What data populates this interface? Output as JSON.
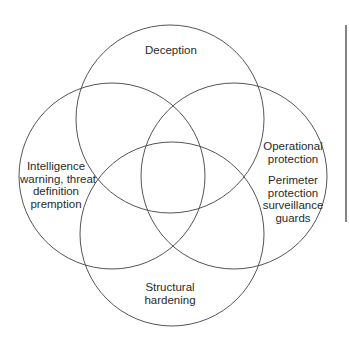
{
  "diagram": {
    "type": "venn",
    "sets": [
      {
        "id": "top",
        "label": "Deception"
      },
      {
        "id": "left",
        "label_lines": [
          "Intelligence",
          "warning, threat",
          "definition",
          "premption"
        ]
      },
      {
        "id": "right",
        "label_lines": [
          "Operational",
          "protection"
        ],
        "sub_label_lines": [
          "Perimeter",
          "protection",
          "surveillance",
          "guards"
        ]
      },
      {
        "id": "bottom",
        "label_lines": [
          "Structural",
          "hardening"
        ]
      }
    ],
    "colors": {
      "stroke": "#555555",
      "text": "#2a2a2a",
      "background": "#ffffff"
    }
  }
}
